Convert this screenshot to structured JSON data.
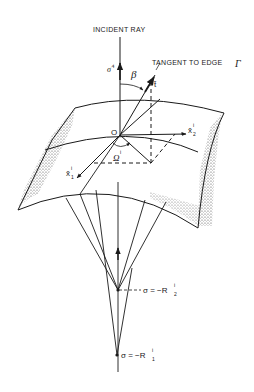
{
  "diagram": {
    "type": "ray-optics geometry (curved edge surface with incident ray and caustics)",
    "labels": {
      "incident_ray": "INCIDENT RAY",
      "tangent_to_edge": "TANGENT TO EDGE",
      "edge_symbol": "Γ",
      "sigma_hat": "σ̂",
      "sigma_sup": "i",
      "beta": "β",
      "t_hat": "t̂",
      "origin": "O",
      "omega": "Ω",
      "omega_sup": "i",
      "x1": "x̂",
      "x1_sub": "1",
      "x1_sup": "i",
      "x2": "x̂",
      "x2_sub": "2",
      "x2_sup": "i",
      "caustic2": "σ = −R",
      "caustic2_sub": "2",
      "caustic2_sup": "i",
      "caustic1": "σ = −R",
      "caustic1_sub": "1",
      "caustic1_sup": "i"
    },
    "colors": {
      "line": "#1a1a1a",
      "shade": "#555555",
      "background": "#ffffff"
    }
  }
}
